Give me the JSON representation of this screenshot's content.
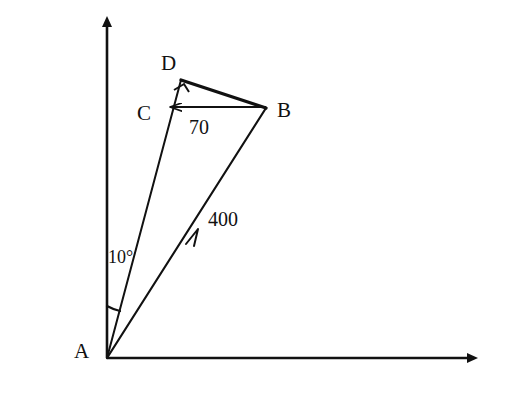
{
  "figure": {
    "type": "geometry-diagram",
    "background_color": "#ffffff",
    "stroke_color": "#111111",
    "width": 509,
    "height": 413
  },
  "axes": {
    "origin_label": "A",
    "vertical_axis_name": "vertical-axis",
    "horizontal_axis_name": "horizontal-axis",
    "arrowheads": "filled-triangle"
  },
  "vertices": [
    {
      "id": "A",
      "label": "A",
      "x": 107,
      "y": 358,
      "label_x": 74,
      "label_y": 341
    },
    {
      "id": "B",
      "label": "B",
      "x": 266,
      "y": 108,
      "label_x": 277,
      "label_y": 100
    },
    {
      "id": "C",
      "label": "C",
      "x": 168,
      "y": 107,
      "label_x": 137,
      "label_y": 103
    },
    {
      "id": "D",
      "label": "D",
      "x": 181,
      "y": 80,
      "label_x": 161,
      "label_y": 53
    }
  ],
  "segments": [
    {
      "name": "segment-AD",
      "from": "A",
      "to": "D",
      "style": "plain"
    },
    {
      "name": "segment-AB",
      "from": "A",
      "to": "B",
      "style": "mid-arrow"
    },
    {
      "name": "segment-DB",
      "from": "D",
      "to": "B",
      "style": "thick"
    },
    {
      "name": "segment-CB",
      "from": "B",
      "to": "C",
      "style": "arrow-to-C"
    }
  ],
  "measures": {
    "ab_length": "400",
    "ab_label_x": 208,
    "ab_label_y": 209,
    "cb_length": "70",
    "cb_label_x": 189,
    "cb_label_y": 117,
    "angle_at_A": "10°",
    "angle_label_x": 108,
    "angle_label_y": 248
  },
  "markers": {
    "right_angle_at": "D",
    "right_angle_name": "right-angle-marker"
  }
}
